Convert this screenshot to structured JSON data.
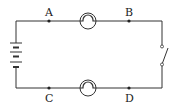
{
  "diagram": {
    "type": "circuit",
    "labels": {
      "A": "A",
      "B": "B",
      "C": "C",
      "D": "D"
    },
    "components": [
      {
        "name": "battery",
        "position": "left"
      },
      {
        "name": "bulb-top",
        "position": "top, between A and B"
      },
      {
        "name": "bulb-bottom",
        "position": "bottom, between C and D"
      },
      {
        "name": "switch",
        "position": "right",
        "state": "open"
      }
    ],
    "colors": {
      "wire": "#333333",
      "background": "#ffffff"
    }
  }
}
